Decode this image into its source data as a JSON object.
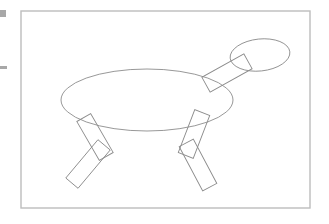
{
  "canvas": {
    "width": 329,
    "height": 224,
    "background_color": "#ffffff",
    "title": "line-drawing-canvas"
  },
  "frame": {
    "name": "drawing-frame",
    "x": 21,
    "y": 11,
    "width": 289,
    "height": 197,
    "stroke_color": "#bdbdbd",
    "stroke_width": 1.4,
    "fill": "none"
  },
  "margin_markers": [
    {
      "name": "margin-marker-square",
      "shape": "square",
      "x": 0,
      "y": 10,
      "width": 6,
      "height": 7,
      "color": "#a8a8a8"
    },
    {
      "name": "margin-marker-dash",
      "shape": "dash",
      "x": 0,
      "y": 66,
      "width": 7,
      "height": 3,
      "color": "#a8a8a8"
    }
  ],
  "drawing": {
    "name": "quadruped-figure",
    "stroke_color": "#8c8c8c",
    "stroke_width": 0.9,
    "fill": "none",
    "shapes": [
      {
        "name": "body-ellipse",
        "type": "ellipse",
        "cx": 147,
        "cy": 100,
        "rx": 86,
        "ry": 31,
        "rotation": 0
      },
      {
        "name": "head-ellipse",
        "type": "ellipse",
        "cx": 260,
        "cy": 55,
        "rx": 30,
        "ry": 16,
        "rotation": -6
      },
      {
        "name": "neck-rectangle",
        "type": "rect",
        "cx": 227,
        "cy": 73,
        "width": 48,
        "height": 17,
        "rotation": -29
      },
      {
        "name": "front-left-upper-leg",
        "type": "rect",
        "cx": 95,
        "cy": 137,
        "width": 16,
        "height": 45,
        "rotation": -30
      },
      {
        "name": "front-left-lower-leg",
        "type": "rect",
        "cx": 88,
        "cy": 164,
        "width": 16,
        "height": 50,
        "rotation": 40
      },
      {
        "name": "hind-right-upper-leg",
        "type": "rect",
        "cx": 194,
        "cy": 134,
        "width": 16,
        "height": 46,
        "rotation": 21
      },
      {
        "name": "hind-right-lower-leg",
        "type": "rect",
        "cx": 198,
        "cy": 165,
        "width": 16,
        "height": 50,
        "rotation": -28
      }
    ]
  }
}
